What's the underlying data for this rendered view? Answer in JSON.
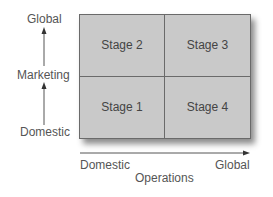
{
  "y_axis": {
    "title": "Marketing",
    "low": "Domestic",
    "high": "Global"
  },
  "x_axis": {
    "title": "Operations",
    "low": "Domestic",
    "high": "Global"
  },
  "quadrants": {
    "top_left": "Stage 2",
    "top_right": "Stage 3",
    "bottom_left": "Stage 1",
    "bottom_right": "Stage 4"
  },
  "colors": {
    "quadrant_fill": "#c9c9c9",
    "lines": "#4a4a4a"
  }
}
